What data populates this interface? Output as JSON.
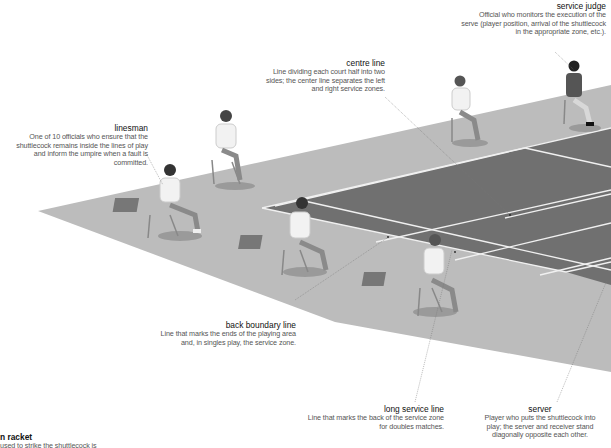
{
  "colors": {
    "background": "#ffffff",
    "floor": "#b9b9b9",
    "court": "#6e6e6e",
    "court_lines": "#f2f2f2",
    "leader_lines": "#666666",
    "term_text": "#111111",
    "desc_text": "#555555"
  },
  "labels": {
    "service_judge": {
      "term": "service judge",
      "desc": "Official who monitors the execution of the serve (player position, arrival of the shuttlecock in the appropriate zone, etc.)."
    },
    "centre_line": {
      "term": "centre line",
      "desc": "Line dividing each court half into two sides; the center line separates the left and right service zones."
    },
    "linesman": {
      "term": "linesman",
      "desc": "One of 10 officials who ensure that the shuttlecock remains inside the lines of play and inform the umpire when a fault is committed."
    },
    "back_boundary_line": {
      "term": "back boundary line",
      "desc": "Line that marks the ends of the playing area and, in singles play, the service zone."
    },
    "long_service_line": {
      "term": "long service line",
      "desc": "Line that marks the back of the service zone for doubles matches."
    },
    "server": {
      "term": "server",
      "desc": "Player who puts the shuttlecock into play; the server and receiver stand diagonally opposite each other."
    },
    "racket": {
      "term": "n racket",
      "desc": "used to strike the shuttlecock is"
    }
  }
}
